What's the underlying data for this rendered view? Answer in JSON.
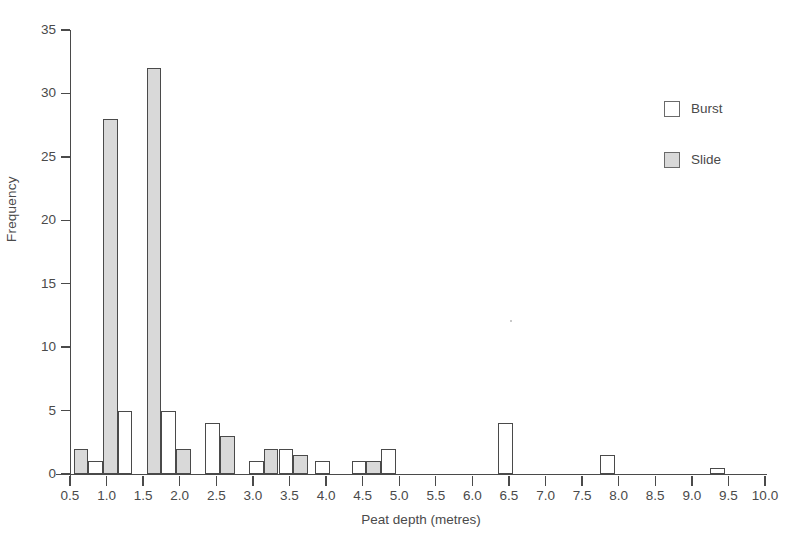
{
  "chart_data": {
    "type": "bar",
    "title": "",
    "subtitle": "",
    "xlabel": "Peat depth (metres)",
    "ylabel": "Frequency",
    "xlim": [
      0.5,
      10.0
    ],
    "ylim": [
      0,
      35
    ],
    "grid": false,
    "bin_width": 0.2,
    "x_tick_labels": [
      "0.5",
      "1.0",
      "1.5",
      "2.0",
      "2.5",
      "3.0",
      "3.5",
      "4.0",
      "4.5",
      "5.0",
      "5.5",
      "6.0",
      "6.5",
      "7.0",
      "7.5",
      "8.0",
      "8.5",
      "9.0",
      "9.5",
      "10.0"
    ],
    "x_tick_values": [
      0.5,
      1.0,
      1.5,
      2.0,
      2.5,
      3.0,
      3.5,
      4.0,
      4.5,
      5.0,
      5.5,
      6.0,
      6.5,
      7.0,
      7.5,
      8.0,
      8.5,
      9.0,
      9.5,
      10.0
    ],
    "y_tick_labels": [
      "0",
      "5",
      "10",
      "15",
      "20",
      "25",
      "30",
      "35"
    ],
    "y_tick_values": [
      0,
      5,
      10,
      15,
      20,
      25,
      30,
      35
    ],
    "legend": {
      "position": "top-right",
      "entries": [
        {
          "label": "Burst",
          "fill": "#ffffff",
          "stroke": "#4a4a4a"
        },
        {
          "label": "Slide",
          "fill": "#d9d9d9",
          "stroke": "#4a4a4a"
        }
      ]
    },
    "series": [
      {
        "name": "Burst",
        "fill": "#ffffff",
        "bars": [
          {
            "x": 0.85,
            "value": 1
          },
          {
            "x": 1.25,
            "value": 5
          },
          {
            "x": 1.85,
            "value": 5
          },
          {
            "x": 2.45,
            "value": 4
          },
          {
            "x": 3.05,
            "value": 1
          },
          {
            "x": 3.45,
            "value": 2
          },
          {
            "x": 3.95,
            "value": 1
          },
          {
            "x": 4.45,
            "value": 1
          },
          {
            "x": 4.85,
            "value": 2
          },
          {
            "x": 6.45,
            "value": 4
          },
          {
            "x": 7.85,
            "value": 1.5
          },
          {
            "x": 9.35,
            "value": 0.5
          }
        ]
      },
      {
        "name": "Slide",
        "fill": "#d9d9d9",
        "bars": [
          {
            "x": 0.65,
            "value": 2
          },
          {
            "x": 1.05,
            "value": 28
          },
          {
            "x": 1.65,
            "value": 32
          },
          {
            "x": 2.05,
            "value": 2
          },
          {
            "x": 2.65,
            "value": 3
          },
          {
            "x": 3.25,
            "value": 2
          },
          {
            "x": 3.65,
            "value": 1.5
          },
          {
            "x": 4.65,
            "value": 1
          }
        ]
      }
    ]
  },
  "colors": {
    "axis": "#4a4a4a",
    "bar_stroke": "#4a4a4a",
    "slide_fill": "#d9d9d9",
    "burst_fill": "#ffffff",
    "background": "#ffffff"
  }
}
